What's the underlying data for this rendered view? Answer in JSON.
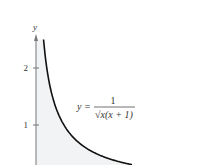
{
  "chart_data": {
    "type": "area",
    "title": "",
    "xlabel": "",
    "ylabel": "y",
    "function": "y = 1/(sqrt(x)(x+1))",
    "annotation": {
      "lhs": "y =",
      "numerator": "1",
      "denominator": "√x(x + 1)"
    },
    "y_ticks": [
      "1",
      "2"
    ],
    "y_tick_values": [
      1,
      2
    ],
    "xlim": [
      0,
      1.6
    ],
    "ylim_visible": [
      0.3,
      2.5
    ],
    "shaded_region": "area under curve",
    "grid": false,
    "colors": {
      "curve": "#111111",
      "fill": "#f1f3f4",
      "axis": "#666666"
    }
  }
}
